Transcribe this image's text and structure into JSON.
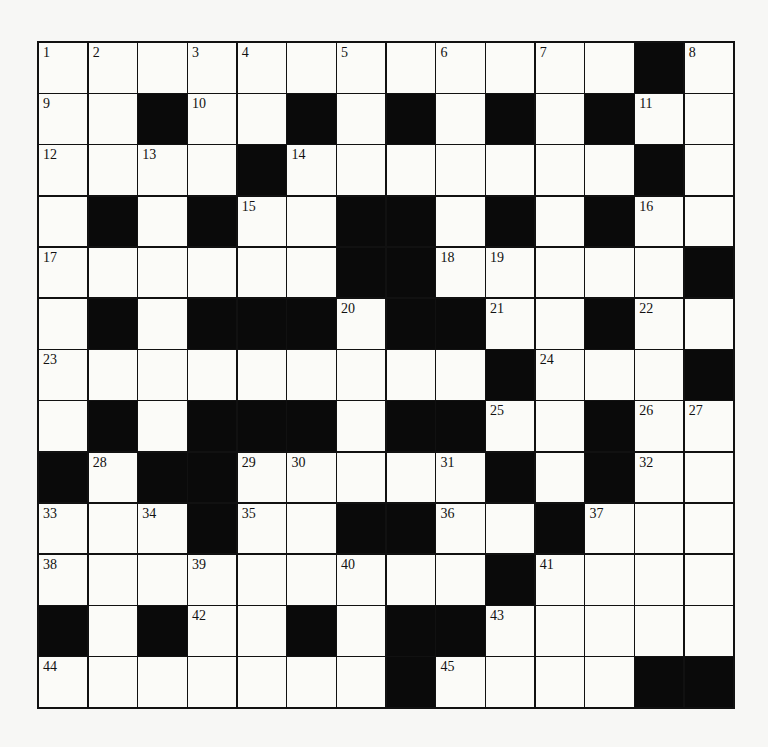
{
  "puzzle": {
    "rows": 13,
    "cols": 14,
    "legend": {
      "#": "black",
      ".": "white"
    },
    "grid": [
      "............#.",
      "..#..#.#.#.#..",
      "....#.......#.",
      ".#.#..##.#.#..",
      "......##.....#",
      ".#.###.##..#..",
      ".........#...#",
      ".#.###.##..#..",
      "#.##.....#.#..",
      "...#..##..#...",
      ".........#....",
      "#.#..#.##.....",
      ".......#....##"
    ],
    "numbers": [
      {
        "r": 0,
        "c": 0,
        "n": "1"
      },
      {
        "r": 0,
        "c": 1,
        "n": "2"
      },
      {
        "r": 0,
        "c": 3,
        "n": "3"
      },
      {
        "r": 0,
        "c": 4,
        "n": "4"
      },
      {
        "r": 0,
        "c": 6,
        "n": "5"
      },
      {
        "r": 0,
        "c": 8,
        "n": "6"
      },
      {
        "r": 0,
        "c": 10,
        "n": "7"
      },
      {
        "r": 0,
        "c": 13,
        "n": "8"
      },
      {
        "r": 1,
        "c": 0,
        "n": "9"
      },
      {
        "r": 1,
        "c": 3,
        "n": "10"
      },
      {
        "r": 1,
        "c": 12,
        "n": "11"
      },
      {
        "r": 2,
        "c": 0,
        "n": "12"
      },
      {
        "r": 2,
        "c": 2,
        "n": "13"
      },
      {
        "r": 2,
        "c": 5,
        "n": "14"
      },
      {
        "r": 3,
        "c": 4,
        "n": "15"
      },
      {
        "r": 3,
        "c": 12,
        "n": "16"
      },
      {
        "r": 4,
        "c": 0,
        "n": "17"
      },
      {
        "r": 4,
        "c": 8,
        "n": "18"
      },
      {
        "r": 4,
        "c": 9,
        "n": "19"
      },
      {
        "r": 5,
        "c": 6,
        "n": "20"
      },
      {
        "r": 5,
        "c": 9,
        "n": "21"
      },
      {
        "r": 5,
        "c": 12,
        "n": "22"
      },
      {
        "r": 6,
        "c": 0,
        "n": "23"
      },
      {
        "r": 6,
        "c": 10,
        "n": "24"
      },
      {
        "r": 7,
        "c": 9,
        "n": "25"
      },
      {
        "r": 7,
        "c": 12,
        "n": "26"
      },
      {
        "r": 7,
        "c": 13,
        "n": "27"
      },
      {
        "r": 8,
        "c": 1,
        "n": "28"
      },
      {
        "r": 8,
        "c": 4,
        "n": "29"
      },
      {
        "r": 8,
        "c": 5,
        "n": "30"
      },
      {
        "r": 8,
        "c": 8,
        "n": "31"
      },
      {
        "r": 8,
        "c": 12,
        "n": "32"
      },
      {
        "r": 9,
        "c": 0,
        "n": "33"
      },
      {
        "r": 9,
        "c": 2,
        "n": "34"
      },
      {
        "r": 9,
        "c": 4,
        "n": "35"
      },
      {
        "r": 9,
        "c": 8,
        "n": "36"
      },
      {
        "r": 9,
        "c": 11,
        "n": "37"
      },
      {
        "r": 10,
        "c": 0,
        "n": "38"
      },
      {
        "r": 10,
        "c": 3,
        "n": "39"
      },
      {
        "r": 10,
        "c": 6,
        "n": "40"
      },
      {
        "r": 10,
        "c": 10,
        "n": "41"
      },
      {
        "r": 11,
        "c": 3,
        "n": "42"
      },
      {
        "r": 11,
        "c": 9,
        "n": "43"
      },
      {
        "r": 12,
        "c": 0,
        "n": "44"
      },
      {
        "r": 12,
        "c": 8,
        "n": "45"
      }
    ]
  }
}
